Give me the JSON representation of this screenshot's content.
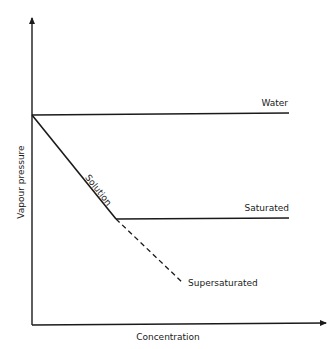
{
  "diagram": {
    "title": "",
    "axes": {
      "x_label": "Concentration",
      "y_label": "Vapour pressure"
    },
    "curves": [
      {
        "id": "water",
        "label": "Water",
        "style": "solid"
      },
      {
        "id": "solution",
        "label": "Solution",
        "style": "solid"
      },
      {
        "id": "saturated",
        "label": "Saturated",
        "style": "solid"
      },
      {
        "id": "supersaturated",
        "label": "Supersaturated",
        "style": "dashed"
      }
    ],
    "colors": {
      "line": "#1a1a1a",
      "background": "#ffffff"
    }
  }
}
